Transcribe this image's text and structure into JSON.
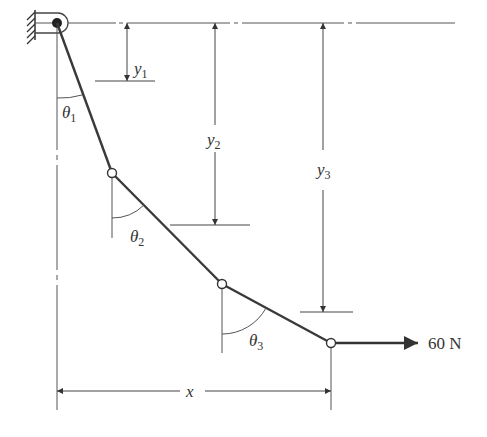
{
  "diagram": {
    "type": "statics-cable-diagram",
    "colors": {
      "ink": "#333333",
      "cable": "#3a3a3a",
      "thin": "#555555",
      "background": "#ffffff"
    },
    "support": {
      "name": "pin-support-at-wall"
    },
    "labels": {
      "y1": {
        "main": "y",
        "sub": "1"
      },
      "y2": {
        "main": "y",
        "sub": "2"
      },
      "y3": {
        "main": "y",
        "sub": "3"
      },
      "theta1": {
        "main": "θ",
        "sub": "1"
      },
      "theta2": {
        "main": "θ",
        "sub": "2"
      },
      "theta3": {
        "main": "θ",
        "sub": "3"
      },
      "x": "x",
      "force": "60 N"
    },
    "segments": [
      {
        "name": "segment-1",
        "from": "support",
        "to": "joint-1"
      },
      {
        "name": "segment-2",
        "from": "joint-1",
        "to": "joint-2"
      },
      {
        "name": "segment-3",
        "from": "joint-2",
        "to": "end-joint"
      }
    ],
    "applied_force": {
      "magnitude": "60 N",
      "direction": "horizontal-right"
    }
  }
}
